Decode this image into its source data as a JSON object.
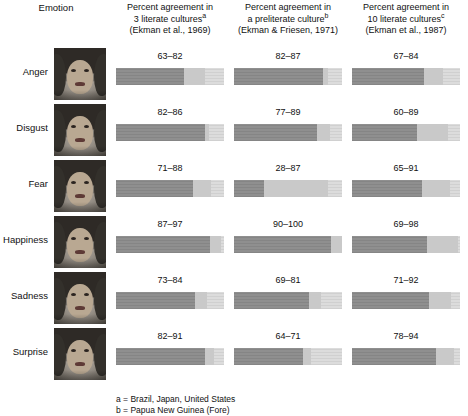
{
  "header": {
    "emotion_label": "Emotion",
    "columns": [
      {
        "line1": "Percent agreement in",
        "line2": "3 literate cultures",
        "sup": "a",
        "line3": "(Ekman et al., 1969)"
      },
      {
        "line1": "Percent agreement in",
        "line2": "a preliterate culture",
        "sup": "b",
        "line3": "(Ekman & Friesen, 1971)"
      },
      {
        "line1": "Percent agreement in",
        "line2": "10 literate cultures",
        "sup": "c",
        "line3": "(Ekman et al., 1987)"
      }
    ]
  },
  "footnotes": [
    "a = Brazil, Japan, United States",
    "b = Papua New Guinea (Fore)"
  ],
  "chart_data": {
    "type": "bar",
    "xlabel": "Percent agreement",
    "ylabel": "Emotion",
    "xlim": [
      0,
      100
    ],
    "grid": false,
    "legend_position": "none",
    "categories": [
      "Anger",
      "Disgust",
      "Fear",
      "Happiness",
      "Sadness",
      "Surprise"
    ],
    "series": [
      {
        "name": "Percent agreement in 3 literate cultures (Ekman et al., 1969)",
        "label": "63–82",
        "ranges": [
          {
            "category": "Anger",
            "low": 63,
            "high": 82,
            "label": "63–82"
          },
          {
            "category": "Disgust",
            "low": 82,
            "high": 86,
            "label": "82–86"
          },
          {
            "category": "Fear",
            "low": 71,
            "high": 88,
            "label": "71–88"
          },
          {
            "category": "Happiness",
            "low": 87,
            "high": 97,
            "label": "87–97"
          },
          {
            "category": "Sadness",
            "low": 73,
            "high": 84,
            "label": "73–84"
          },
          {
            "category": "Surprise",
            "low": 82,
            "high": 91,
            "label": "82–91"
          }
        ]
      },
      {
        "name": "Percent agreement in a preliterate culture (Ekman & Friesen, 1971)",
        "label": "82–87",
        "ranges": [
          {
            "category": "Anger",
            "low": 82,
            "high": 87,
            "label": "82–87"
          },
          {
            "category": "Disgust",
            "low": 77,
            "high": 89,
            "label": "77–89"
          },
          {
            "category": "Fear",
            "low": 28,
            "high": 87,
            "label": "28–87"
          },
          {
            "category": "Happiness",
            "low": 90,
            "high": 100,
            "label": "90–100"
          },
          {
            "category": "Sadness",
            "low": 69,
            "high": 81,
            "label": "69–81"
          },
          {
            "category": "Surprise",
            "low": 64,
            "high": 71,
            "label": "64–71"
          }
        ]
      },
      {
        "name": "Percent agreement in 10 literate cultures (Ekman et al., 1987)",
        "label": "67–84",
        "ranges": [
          {
            "category": "Anger",
            "low": 67,
            "high": 84,
            "label": "67–84"
          },
          {
            "category": "Disgust",
            "low": 60,
            "high": 89,
            "label": "60–89"
          },
          {
            "category": "Fear",
            "low": 65,
            "high": 91,
            "label": "65–91"
          },
          {
            "category": "Happiness",
            "low": 69,
            "high": 98,
            "label": "69–98"
          },
          {
            "category": "Sadness",
            "low": 71,
            "high": 92,
            "label": "71–92"
          },
          {
            "category": "Surprise",
            "low": 78,
            "high": 94,
            "label": "78–94"
          }
        ]
      }
    ]
  },
  "faces": [
    {
      "emotion": "Anger",
      "alt": "angry-face-photo"
    },
    {
      "emotion": "Disgust",
      "alt": "disgust-face-photo"
    },
    {
      "emotion": "Fear",
      "alt": "fear-face-photo"
    },
    {
      "emotion": "Happiness",
      "alt": "happy-face-photo"
    },
    {
      "emotion": "Sadness",
      "alt": "sad-face-photo"
    },
    {
      "emotion": "Surprise",
      "alt": "surprise-face-photo"
    }
  ],
  "colors": {
    "bar_fill": "#8f8f8f",
    "bar_track": "#dcdcdc",
    "text": "#111111"
  }
}
